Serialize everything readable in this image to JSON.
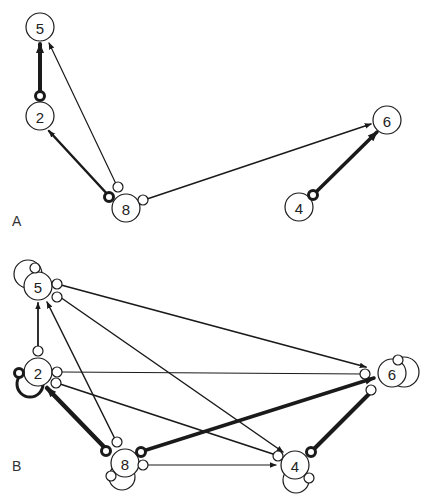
{
  "panels": [
    {
      "label": "A",
      "label_pos": [
        12,
        226
      ],
      "nodes": [
        {
          "id": "5",
          "label": "5",
          "x": 40,
          "y": 27,
          "r": 14
        },
        {
          "id": "2",
          "label": "2",
          "x": 40,
          "y": 116,
          "r": 14
        },
        {
          "id": "8",
          "label": "8",
          "x": 126,
          "y": 208,
          "r": 14
        },
        {
          "id": "6",
          "label": "6",
          "x": 387,
          "y": 120,
          "r": 14
        },
        {
          "id": "4",
          "label": "4",
          "x": 299,
          "y": 207,
          "r": 14
        }
      ],
      "edges": [
        {
          "from": "2",
          "to": "5",
          "x1": 40,
          "y1": 96,
          "x2": 40,
          "y2": 44,
          "width": 4,
          "start": "bold",
          "sx": 40,
          "sy": 96
        },
        {
          "from": "8",
          "to": "5",
          "x1": 117,
          "y1": 186,
          "x2": 49,
          "y2": 43,
          "width": 1.2,
          "start": "open",
          "sx": 118,
          "sy": 187
        },
        {
          "from": "8",
          "to": "2",
          "x1": 109,
          "y1": 196,
          "x2": 49,
          "y2": 131,
          "width": 2.5,
          "start": "bold",
          "sx": 109,
          "sy": 197
        },
        {
          "from": "8",
          "to": "6",
          "x1": 144,
          "y1": 200,
          "x2": 371,
          "y2": 124,
          "width": 1.5,
          "start": "open",
          "sx": 143,
          "sy": 200
        },
        {
          "from": "4",
          "to": "6",
          "x1": 313,
          "y1": 195,
          "x2": 377,
          "y2": 132,
          "width": 3.5,
          "start": "bold",
          "sx": 313,
          "sy": 195
        }
      ],
      "self_loops": []
    },
    {
      "label": "B",
      "label_pos": [
        12,
        471
      ],
      "nodes": [
        {
          "id": "5",
          "label": "5",
          "x": 38,
          "y": 286,
          "r": 14
        },
        {
          "id": "2",
          "label": "2",
          "x": 38,
          "y": 372,
          "r": 14
        },
        {
          "id": "8",
          "label": "8",
          "x": 125,
          "y": 463,
          "r": 14
        },
        {
          "id": "6",
          "label": "6",
          "x": 392,
          "y": 373,
          "r": 14
        },
        {
          "id": "4",
          "label": "4",
          "x": 295,
          "y": 465,
          "r": 14
        }
      ],
      "edges": [
        {
          "from": "2",
          "to": "5",
          "x1": 38,
          "y1": 350,
          "x2": 38,
          "y2": 303,
          "width": 1.8,
          "start": "open",
          "sx": 38,
          "sy": 351
        },
        {
          "from": "8",
          "to": "5",
          "x1": 116,
          "y1": 441,
          "x2": 47,
          "y2": 302,
          "width": 1.5,
          "start": "open",
          "sx": 117,
          "sy": 442
        },
        {
          "from": "5",
          "to": "6",
          "x1": 61,
          "y1": 285,
          "x2": 366,
          "y2": 367,
          "width": 1.8,
          "start": "open",
          "sx": 57,
          "sy": 284
        },
        {
          "from": "5",
          "to": "4",
          "x1": 60,
          "y1": 297,
          "x2": 283,
          "y2": 452,
          "width": 1.5,
          "start": "open",
          "sx": 57,
          "sy": 297
        },
        {
          "from": "2",
          "to": "6",
          "x1": 60,
          "y1": 372,
          "x2": 364,
          "y2": 374,
          "width": 1,
          "start": "open",
          "sx": 57,
          "sy": 372,
          "arrow": false,
          "end_open": [
            365,
            374
          ]
        },
        {
          "from": "2",
          "to": "4",
          "x1": 60,
          "y1": 384,
          "x2": 276,
          "y2": 455,
          "width": 1.8,
          "start": "open",
          "sx": 56,
          "sy": 383,
          "arrow": false,
          "end_open": [
            278,
            456
          ]
        },
        {
          "from": "8",
          "to": "2",
          "x1": 107,
          "y1": 450,
          "x2": 47,
          "y2": 388,
          "width": 4.5,
          "start": "bold",
          "sx": 106,
          "sy": 451
        },
        {
          "from": "8",
          "to": "6",
          "x1": 143,
          "y1": 451,
          "x2": 374,
          "y2": 378,
          "width": 3.5,
          "start": "bold",
          "sx": 141,
          "sy": 452
        },
        {
          "from": "8",
          "to": "4",
          "x1": 147,
          "y1": 465,
          "x2": 276,
          "y2": 465,
          "width": 1.2,
          "start": "open",
          "sx": 143,
          "sy": 465
        },
        {
          "from": "4",
          "to": "6",
          "x1": 311,
          "y1": 452,
          "x2": 370,
          "y2": 393,
          "width": 4,
          "start": "bold",
          "sx": 311,
          "sy": 452,
          "arrow": false,
          "end_open": [
            371,
            390
          ]
        }
      ],
      "self_loops": [
        {
          "node": "5",
          "cx": 28,
          "cy": 274,
          "r": 14,
          "width": 1.2,
          "port": [
            35,
            268
          ]
        },
        {
          "node": "2",
          "cx": 30,
          "cy": 384,
          "r": 13,
          "width": 3,
          "port": [
            19,
            373
          ],
          "bold": true
        },
        {
          "node": "8",
          "cx": 122,
          "cy": 477,
          "r": 13,
          "width": 1.2,
          "port": [
            111,
            476
          ]
        },
        {
          "node": "6",
          "cx": 404,
          "cy": 372,
          "r": 15,
          "width": 1.2,
          "port": [
            398,
            360
          ]
        },
        {
          "node": "4",
          "cx": 296,
          "cy": 480,
          "r": 13,
          "width": 1.2,
          "port": [
            309,
            478
          ]
        }
      ]
    }
  ],
  "colors": {
    "stroke": "#1a1a1a",
    "background": "#ffffff"
  }
}
